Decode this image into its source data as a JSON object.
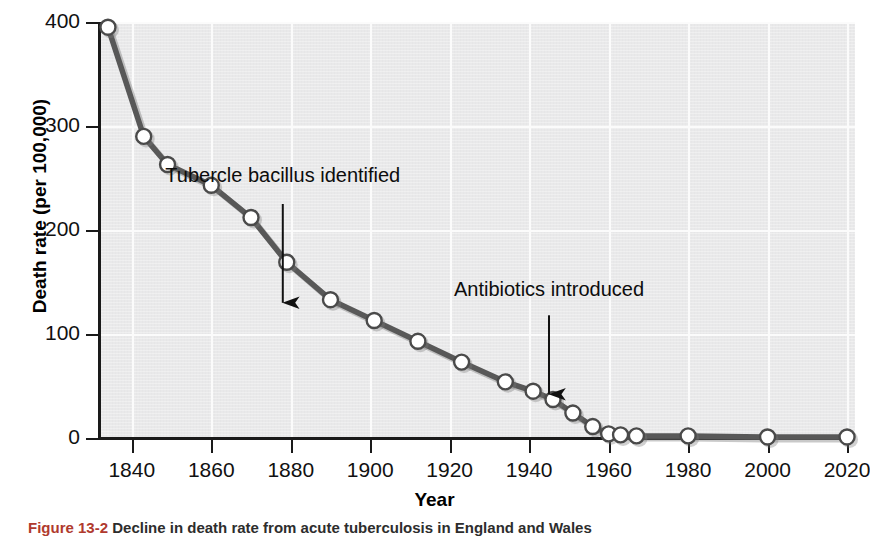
{
  "figure": {
    "caption_number": "Figure 13-2",
    "caption_text": "Decline in death rate from acute tuberculosis in England and Wales"
  },
  "chart_data": {
    "type": "line",
    "title": "",
    "xlabel": "Year",
    "ylabel": "Death rate (per 100,000)",
    "xlim": [
      1832,
      2022
    ],
    "ylim": [
      0,
      400
    ],
    "grid": true,
    "legend": "none",
    "marker": "open-circle",
    "line_color": "#585858",
    "marker_fill": "#ffffff",
    "marker_edge": "#4a4a4a",
    "plot_background": "#e9e9ea",
    "gridline_color": "#fbfbfb",
    "xticks": [
      1840,
      1860,
      1880,
      1900,
      1920,
      1940,
      1960,
      1980,
      2000,
      2020
    ],
    "xticklabels": [
      "1840",
      "1860",
      "1880",
      "1900",
      "1920",
      "1940",
      "1960",
      "1980",
      "2000",
      "2020"
    ],
    "yticks": [
      0,
      100,
      200,
      300,
      400
    ],
    "yticklabels": [
      "0",
      "100",
      "200",
      "300",
      "400"
    ],
    "x": [
      1834,
      1843,
      1849,
      1860,
      1870,
      1879,
      1890,
      1901,
      1912,
      1923,
      1934,
      1941,
      1946,
      1951,
      1956,
      1960,
      1963,
      1967,
      1980,
      2000,
      2020
    ],
    "y": [
      395,
      290,
      263,
      243,
      212,
      169,
      133,
      113,
      93,
      73,
      54,
      45,
      37,
      24,
      11,
      4,
      3,
      2,
      2,
      1,
      1
    ],
    "annotations": [
      {
        "text": "Tubercle bacillus identified",
        "x": 1878,
        "y_text": 250,
        "arrow_from_y": 225,
        "arrow_to_y": 130
      },
      {
        "text": "Antibiotics introduced",
        "x": 1945,
        "y_text": 140,
        "arrow_from_y": 118,
        "arrow_to_y": 42
      }
    ]
  }
}
